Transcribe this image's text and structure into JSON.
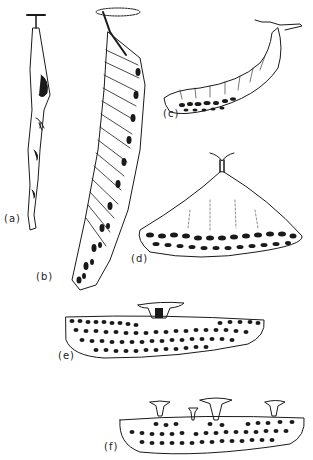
{
  "figure": {
    "panels": [
      {
        "id": "a",
        "label": "(a)",
        "description": "narrow stalked linear comb, twisted"
      },
      {
        "id": "b",
        "label": "(b)",
        "description": "long elongated comb hanging from a single petiole"
      },
      {
        "id": "c",
        "label": "(c)",
        "description": "curved sausage-shaped nest with cells along bottom"
      },
      {
        "id": "d",
        "label": "(d)",
        "description": "conical nest with petiole at apex, cells at base"
      },
      {
        "id": "e",
        "label": "(e)",
        "description": "flat elongated comb with single central petiole"
      },
      {
        "id": "f",
        "label": "(f)",
        "description": "flat elongated comb with multiple petioles"
      }
    ]
  },
  "colors": {
    "ink": "#1a1a1a",
    "background": "#ffffff"
  }
}
